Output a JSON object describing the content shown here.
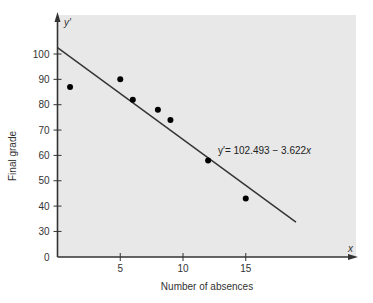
{
  "chart_data": {
    "type": "scatter",
    "title": "",
    "xlabel": "Number of absences",
    "ylabel": "Final grade",
    "x_axis_symbol": "x",
    "y_axis_symbol": "y′",
    "xlim": [
      0,
      24
    ],
    "ylim": [
      0,
      110
    ],
    "y_axis_break": true,
    "x_ticks": [
      5,
      10,
      15
    ],
    "y_ticks": [
      0,
      30,
      40,
      50,
      60,
      70,
      80,
      90,
      100
    ],
    "grid": false,
    "points": [
      {
        "x": 1,
        "y": 87
      },
      {
        "x": 5,
        "y": 90
      },
      {
        "x": 6,
        "y": 82
      },
      {
        "x": 8,
        "y": 78
      },
      {
        "x": 9,
        "y": 74
      },
      {
        "x": 12,
        "y": 58
      },
      {
        "x": 15,
        "y": 43
      }
    ],
    "regression_line": {
      "intercept": 102.493,
      "slope": -3.622,
      "x_range": [
        0,
        19
      ],
      "label": "y′ = 102.493 − 3.622x",
      "label_main": "y′= 102.493 − 3.622",
      "label_var": "x"
    },
    "colors": {
      "plot_background": "#e8e8e8",
      "axis": "#333333",
      "points": "#000000",
      "line": "#333333"
    }
  }
}
